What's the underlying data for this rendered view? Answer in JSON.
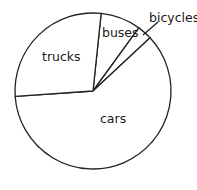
{
  "chart_data": {
    "type": "pie",
    "title": "",
    "categories": [
      "buses",
      "bicycles",
      "cars",
      "trucks"
    ],
    "values": [
      8,
      3,
      61,
      28
    ],
    "angles_deg": [
      30,
      11,
      219,
      100
    ],
    "start_angle_deg_clockwise_from_top": 6,
    "legend": "none (direct labels)",
    "colors": {
      "fill": "#ffffff",
      "stroke": "#222222"
    }
  },
  "labels": {
    "trucks": "trucks",
    "buses": "buses",
    "bicycles": "bicycles",
    "cars": "cars"
  }
}
